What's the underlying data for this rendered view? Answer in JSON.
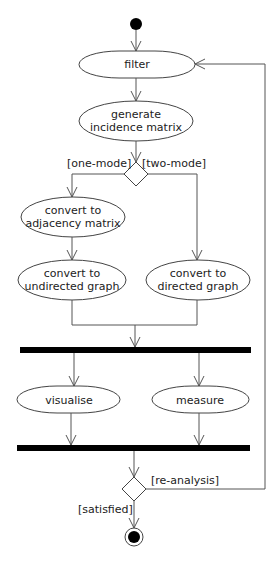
{
  "diagram": {
    "type": "UML activity diagram",
    "nodes": {
      "start": {
        "kind": "initial"
      },
      "filter": {
        "label": "filter"
      },
      "generate": {
        "line1": "generate",
        "line2": "incidence matrix"
      },
      "decision_mode": {
        "kind": "decision"
      },
      "adjacency": {
        "line1": "convert to",
        "line2": "adjacency matrix"
      },
      "undirected": {
        "line1": "convert to",
        "line2": "undirected graph"
      },
      "directed": {
        "line1": "convert to",
        "line2": "directed graph"
      },
      "fork": {
        "kind": "fork bar"
      },
      "visualise": {
        "label": "visualise"
      },
      "measure": {
        "label": "measure"
      },
      "join": {
        "kind": "join bar"
      },
      "decision_end": {
        "kind": "decision"
      },
      "end": {
        "kind": "final"
      }
    },
    "guards": {
      "one_mode": "[one-mode]",
      "two_mode": "[two-mode]",
      "re_analysis": "[re-analysis]",
      "satisfied": "[satisfied]"
    },
    "edges": [
      {
        "from": "start",
        "to": "filter"
      },
      {
        "from": "filter",
        "to": "generate"
      },
      {
        "from": "generate",
        "to": "decision_mode"
      },
      {
        "from": "decision_mode",
        "to": "adjacency",
        "guard": "[one-mode]"
      },
      {
        "from": "decision_mode",
        "to": "directed",
        "guard": "[two-mode]"
      },
      {
        "from": "adjacency",
        "to": "undirected"
      },
      {
        "from": "undirected",
        "to": "fork"
      },
      {
        "from": "directed",
        "to": "fork"
      },
      {
        "from": "fork",
        "to": "visualise"
      },
      {
        "from": "fork",
        "to": "measure"
      },
      {
        "from": "visualise",
        "to": "join"
      },
      {
        "from": "measure",
        "to": "join"
      },
      {
        "from": "join",
        "to": "decision_end"
      },
      {
        "from": "decision_end",
        "to": "filter",
        "guard": "[re-analysis]"
      },
      {
        "from": "decision_end",
        "to": "end",
        "guard": "[satisfied]"
      }
    ]
  }
}
